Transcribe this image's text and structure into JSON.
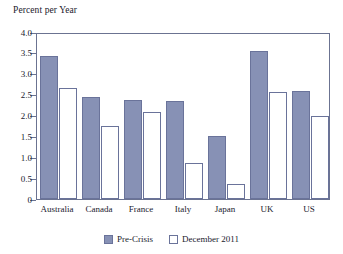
{
  "chart_data": {
    "type": "bar",
    "title": "Percent per Year",
    "xlabel": "",
    "ylabel": "Percent per Year",
    "ylim": [
      0,
      4.0
    ],
    "ytick_labels": [
      "4.0",
      "3.5",
      "3.0",
      "2.5",
      "2.0",
      "1.5",
      "1.0",
      "0.5",
      "0"
    ],
    "ytick_values": [
      4.0,
      3.5,
      3.0,
      2.5,
      2.0,
      1.5,
      1.0,
      0.5,
      0
    ],
    "grid": false,
    "legend_position": "bottom-center",
    "categories": [
      "Australia",
      "Canada",
      "France",
      "Italy",
      "Japan",
      "UK",
      "US"
    ],
    "series": [
      {
        "name": "Pre-Crisis",
        "color": "#8791b5",
        "values": [
          3.43,
          2.45,
          2.37,
          2.34,
          1.5,
          3.54,
          2.58
        ]
      },
      {
        "name": "December 2011",
        "color": "#ffffff",
        "values": [
          2.65,
          1.76,
          2.08,
          0.86,
          0.35,
          2.57,
          2.0
        ]
      }
    ]
  },
  "colors": {
    "bar_fill": "#8791b5",
    "bar_outline": "#6a739a",
    "axis": "#6b7391",
    "text": "#1a1a2e",
    "background": "#ffffff"
  }
}
